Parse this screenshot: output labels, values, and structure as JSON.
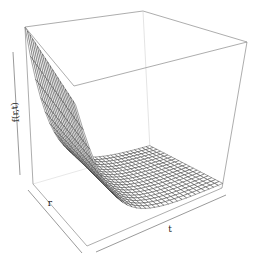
{
  "chart_data": {
    "type": "surface3d",
    "title": "",
    "zlabel": "f(r,t)",
    "xlabel": "r",
    "ylabel": "t",
    "ticks": false,
    "box": true,
    "grid": {
      "nr": 20,
      "nt": 30
    },
    "function": "f(r,t) = exp(-k*t) * (1 + 0.15*r) , k≈6, normalized to [0,1]",
    "ranges": {
      "r": [
        0,
        1
      ],
      "t": [
        0,
        1
      ],
      "f": [
        0,
        1
      ]
    },
    "colors": {
      "line": "#333333",
      "box": "#8a8a8a",
      "surface": "#ffffff"
    }
  }
}
